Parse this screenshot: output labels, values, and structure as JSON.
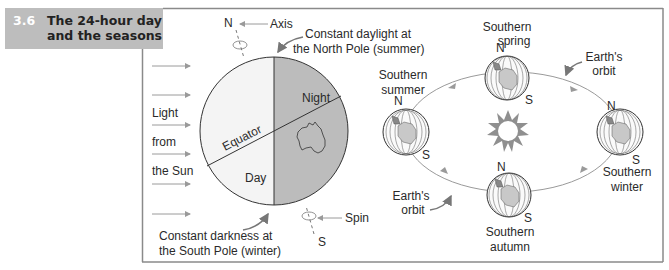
{
  "title": {
    "number": "3.6",
    "line1": "The 24-hour day",
    "line2": "and the seasons"
  },
  "left_panel": {
    "light_label": [
      "Light",
      "from",
      "the Sun"
    ],
    "north_label": "N",
    "south_label": "S",
    "axis_label": "Axis",
    "spin_label": "Spin",
    "daylight_note": [
      "Constant daylight at",
      "the North Pole (summer)"
    ],
    "darkness_note": [
      "Constant darkness at",
      "the South Pole (winter)"
    ],
    "night_label": "Night",
    "day_label": "Day",
    "equator_label": "Equator"
  },
  "right_panel": {
    "orbit_label_top": [
      "Earth's",
      "orbit"
    ],
    "orbit_label_bottom": [
      "Earth's",
      "orbit"
    ],
    "seasons": {
      "spring": [
        "Southern",
        "spring"
      ],
      "summer": [
        "Southern",
        "summer"
      ],
      "winter": [
        "Southern",
        "winter"
      ],
      "autumn": [
        "Southern",
        "autumn"
      ]
    },
    "n": "N",
    "s": "S"
  },
  "colors": {
    "title_bg": "#bdbdbd",
    "frame": "#8a8a8a",
    "night": "#bcbcbc",
    "day": "#f4f4f4",
    "sun": "#8f8f8f",
    "arrow": "#9a9a9a"
  }
}
